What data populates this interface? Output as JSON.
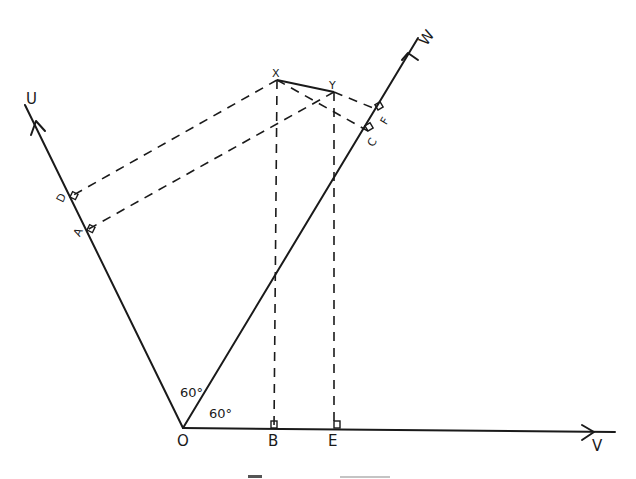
{
  "figure": {
    "type": "geometry-projection-diagram",
    "colors": {
      "ink": "#1a1a1a",
      "background": "#ffffff"
    },
    "origin": {
      "label": "O",
      "x": 183,
      "y": 428
    },
    "axes": [
      {
        "id": "U",
        "label": "U",
        "from": [
          183,
          428
        ],
        "to": [
          25,
          105
        ]
      },
      {
        "id": "W",
        "label": "W",
        "from": [
          183,
          428
        ],
        "to": [
          418,
          38
        ]
      },
      {
        "id": "V",
        "label": "V",
        "from": [
          183,
          428
        ],
        "to": [
          615,
          432
        ]
      }
    ],
    "points": [
      {
        "id": "X",
        "label": "X",
        "x": 277,
        "y": 80
      },
      {
        "id": "Y",
        "label": "Y",
        "x": 334,
        "y": 92
      }
    ],
    "segment": {
      "from": "X",
      "to": "Y",
      "style": "solid"
    },
    "projections": [
      {
        "from": "X",
        "to": "D",
        "axis": "U",
        "foot": [
          70,
          197
        ]
      },
      {
        "from": "Y",
        "to": "A",
        "axis": "U",
        "foot": [
          87,
          230
        ]
      },
      {
        "from": "X",
        "to": "C",
        "axis": "W",
        "foot": [
          368,
          131
        ]
      },
      {
        "from": "Y",
        "to": "F",
        "axis": "W",
        "foot": [
          378,
          110
        ]
      },
      {
        "from": "X",
        "to": "B",
        "axis": "V",
        "foot": [
          274,
          428
        ]
      },
      {
        "from": "Y",
        "to": "E",
        "axis": "V",
        "foot": [
          334,
          428
        ]
      }
    ],
    "foot_labels": {
      "D": "D",
      "A": "A",
      "C": "C",
      "F": "F",
      "B": "B",
      "E": "E"
    },
    "angles": [
      {
        "label": "60°",
        "between": [
          "U",
          "W"
        ]
      },
      {
        "label": "60°",
        "between": [
          "W",
          "V"
        ]
      }
    ],
    "caption": ""
  }
}
